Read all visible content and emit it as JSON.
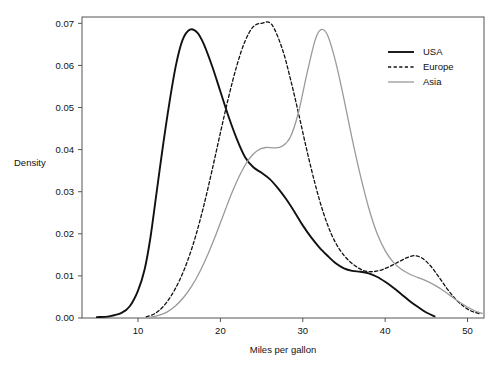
{
  "chart_data": {
    "type": "line",
    "title": "",
    "xlabel": "Miles per gallon",
    "ylabel": "Density",
    "xlim": [
      3.2,
      52.0
    ],
    "ylim": [
      0.0,
      0.0715
    ],
    "xticks": [
      10,
      20,
      30,
      40,
      50
    ],
    "xtick_labels": [
      "10",
      "20",
      "30",
      "40",
      "50"
    ],
    "yticks": [
      0.0,
      0.01,
      0.02,
      0.03,
      0.04,
      0.05,
      0.06,
      0.07
    ],
    "ytick_labels": [
      "0.00",
      "0.01",
      "0.02",
      "0.03",
      "0.04",
      "0.05",
      "0.06",
      "0.07"
    ],
    "grid": false,
    "legend_position": "top-right",
    "series": [
      {
        "name": "USA",
        "color": "#111111",
        "style": "solid",
        "width": 1.9,
        "x": [
          5.0,
          6.5,
          8.0,
          9.0,
          10.0,
          10.8,
          11.5,
          12.2,
          13.0,
          13.8,
          14.6,
          15.4,
          16.3,
          17.2,
          18.0,
          19.0,
          20.0,
          21.0,
          22.0,
          23.0,
          24.0,
          25.0,
          26.0,
          27.0,
          28.0,
          29.0,
          30.0,
          31.0,
          32.0,
          33.0,
          34.0,
          35.0,
          36.0,
          37.0,
          38.0,
          39.0,
          40.0,
          41.0,
          42.0,
          43.0,
          44.0,
          45.0,
          46.0
        ],
        "y": [
          0.0002,
          0.0004,
          0.0012,
          0.0028,
          0.0065,
          0.0115,
          0.019,
          0.029,
          0.0405,
          0.051,
          0.06,
          0.066,
          0.0685,
          0.0678,
          0.065,
          0.0598,
          0.0538,
          0.0478,
          0.0425,
          0.0382,
          0.0358,
          0.0345,
          0.033,
          0.0308,
          0.0282,
          0.0252,
          0.022,
          0.0192,
          0.0168,
          0.0148,
          0.013,
          0.0118,
          0.0112,
          0.011,
          0.0106,
          0.0098,
          0.0086,
          0.0072,
          0.0056,
          0.004,
          0.0026,
          0.0013,
          0.0004
        ]
      },
      {
        "name": "Europe",
        "color": "#111111",
        "style": "dashed",
        "width": 1.3,
        "x": [
          11.0,
          12.0,
          13.0,
          14.0,
          15.0,
          16.0,
          17.0,
          18.0,
          19.0,
          20.0,
          21.0,
          22.0,
          23.0,
          24.0,
          25.0,
          26.2,
          27.5,
          28.5,
          29.5,
          30.5,
          31.5,
          32.5,
          33.5,
          34.5,
          35.5,
          36.5,
          37.5,
          38.5,
          39.5,
          40.5,
          41.5,
          42.5,
          43.5,
          44.5,
          45.5,
          46.5,
          47.5,
          48.5,
          49.5,
          50.5,
          51.5
        ],
        "y": [
          0.0003,
          0.001,
          0.0026,
          0.0052,
          0.0088,
          0.0135,
          0.0195,
          0.0268,
          0.0352,
          0.044,
          0.0525,
          0.06,
          0.0658,
          0.0692,
          0.07,
          0.0698,
          0.064,
          0.0568,
          0.0485,
          0.0398,
          0.0318,
          0.025,
          0.0198,
          0.0162,
          0.0138,
          0.0122,
          0.0112,
          0.011,
          0.0114,
          0.0122,
          0.0132,
          0.0142,
          0.0148,
          0.0142,
          0.0124,
          0.0098,
          0.007,
          0.0046,
          0.0028,
          0.0016,
          0.001
        ]
      },
      {
        "name": "Asia",
        "color": "#9a9a9a",
        "style": "solid",
        "width": 1.3,
        "x": [
          11.5,
          12.5,
          13.5,
          14.5,
          15.5,
          16.5,
          17.5,
          18.5,
          19.5,
          20.5,
          21.5,
          22.5,
          23.5,
          24.5,
          25.5,
          26.5,
          27.5,
          28.5,
          29.5,
          30.5,
          31.5,
          32.2,
          33.0,
          34.0,
          35.0,
          36.0,
          37.0,
          38.0,
          39.0,
          40.0,
          41.0,
          42.0,
          43.0,
          44.0,
          45.0,
          46.0,
          47.0,
          48.0,
          49.0,
          50.0,
          51.0,
          51.8
        ],
        "y": [
          0.0002,
          0.0006,
          0.0014,
          0.0028,
          0.0048,
          0.0075,
          0.011,
          0.0152,
          0.02,
          0.0252,
          0.0302,
          0.0345,
          0.0378,
          0.0398,
          0.0405,
          0.0404,
          0.0408,
          0.043,
          0.049,
          0.058,
          0.066,
          0.0685,
          0.0672,
          0.0608,
          0.052,
          0.0425,
          0.0338,
          0.0262,
          0.0202,
          0.016,
          0.0132,
          0.0115,
          0.0104,
          0.0096,
          0.0088,
          0.0078,
          0.0066,
          0.0052,
          0.0038,
          0.0026,
          0.0016,
          0.0011
        ]
      }
    ]
  },
  "legend": {
    "entries": [
      {
        "label": "USA"
      },
      {
        "label": "Europe"
      },
      {
        "label": "Asia"
      }
    ]
  }
}
